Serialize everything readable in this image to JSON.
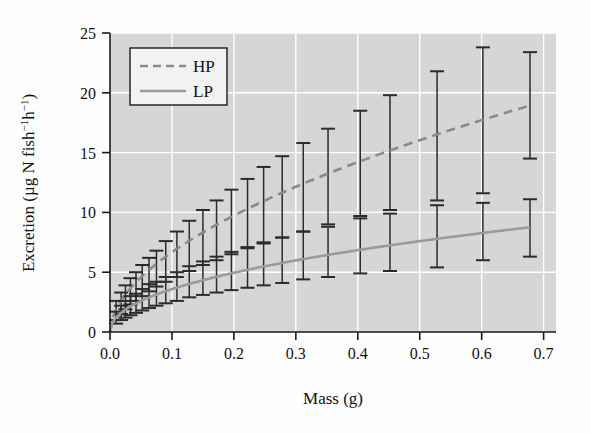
{
  "chart_data": {
    "type": "line",
    "title": "",
    "subtitle": "",
    "xlabel": "Mass (g)",
    "ylabel": "Excretion (µg N fish⁻¹h⁻¹)",
    "xlim": [
      0.0,
      0.72
    ],
    "ylim": [
      0,
      25
    ],
    "xticks": [
      "0.0",
      "0.1",
      "0.2",
      "0.3",
      "0.4",
      "0.5",
      "0.6",
      "0.7"
    ],
    "xtick_values": [
      0.0,
      0.1,
      0.2,
      0.3,
      0.4,
      0.5,
      0.6,
      0.7
    ],
    "yticks": [
      "0",
      "5",
      "10",
      "15",
      "20",
      "25"
    ],
    "ytick_values": [
      0,
      5,
      10,
      15,
      20,
      25
    ],
    "grid": true,
    "grid_color": "#ffffff",
    "plot_background": "#d6d6d6",
    "legend_position": "upper-left",
    "legend_entries": [
      {
        "label": "HP",
        "style": "dashed",
        "color": "#8a8a8a"
      },
      {
        "label": "LP",
        "style": "solid",
        "color": "#9a9a9a"
      }
    ],
    "series": [
      {
        "name": "HP",
        "style": "dashed",
        "color": "#8a8a8a",
        "fit_curve": {
          "model": "power",
          "a": 23.4,
          "b": 0.545,
          "note": "Excretion = a * Mass^b"
        },
        "points": [
          {
            "x": 0.01,
            "y": 1.8,
            "err_low": 1.0,
            "err_high": 2.6
          },
          {
            "x": 0.018,
            "y": 2.4,
            "err_low": 1.5,
            "err_high": 3.3
          },
          {
            "x": 0.025,
            "y": 2.9,
            "err_low": 1.9,
            "err_high": 3.9
          },
          {
            "x": 0.033,
            "y": 3.4,
            "err_low": 2.3,
            "err_high": 4.5
          },
          {
            "x": 0.042,
            "y": 3.8,
            "err_low": 2.6,
            "err_high": 5.0
          },
          {
            "x": 0.052,
            "y": 4.3,
            "err_low": 3.0,
            "err_high": 5.6
          },
          {
            "x": 0.063,
            "y": 4.8,
            "err_low": 3.4,
            "err_high": 6.2
          },
          {
            "x": 0.075,
            "y": 5.3,
            "err_low": 3.8,
            "err_high": 6.8
          },
          {
            "x": 0.09,
            "y": 5.9,
            "err_low": 4.2,
            "err_high": 7.6
          },
          {
            "x": 0.108,
            "y": 6.5,
            "err_low": 4.6,
            "err_high": 8.4
          },
          {
            "x": 0.128,
            "y": 7.2,
            "err_low": 5.1,
            "err_high": 9.3
          },
          {
            "x": 0.15,
            "y": 7.9,
            "err_low": 5.6,
            "err_high": 10.2
          },
          {
            "x": 0.172,
            "y": 8.5,
            "err_low": 6.0,
            "err_high": 11.0
          },
          {
            "x": 0.196,
            "y": 9.2,
            "err_low": 6.5,
            "err_high": 11.9
          },
          {
            "x": 0.222,
            "y": 9.9,
            "err_low": 7.0,
            "err_high": 12.8
          },
          {
            "x": 0.248,
            "y": 10.6,
            "err_low": 7.4,
            "err_high": 13.8
          },
          {
            "x": 0.278,
            "y": 11.3,
            "err_low": 7.9,
            "err_high": 14.7
          },
          {
            "x": 0.312,
            "y": 12.1,
            "err_low": 8.4,
            "err_high": 15.8
          },
          {
            "x": 0.352,
            "y": 13.0,
            "err_low": 9.0,
            "err_high": 17.0
          },
          {
            "x": 0.404,
            "y": 14.1,
            "err_low": 9.7,
            "err_high": 18.5
          },
          {
            "x": 0.452,
            "y": 15.0,
            "err_low": 10.2,
            "err_high": 19.8
          },
          {
            "x": 0.528,
            "y": 16.4,
            "err_low": 11.0,
            "err_high": 21.8
          },
          {
            "x": 0.602,
            "y": 17.7,
            "err_low": 11.6,
            "err_high": 23.8
          },
          {
            "x": 0.678,
            "y": 19.0,
            "err_low": 14.5,
            "err_high": 23.4
          }
        ]
      },
      {
        "name": "LP",
        "style": "solid",
        "color": "#9a9a9a",
        "fit_curve": {
          "model": "power",
          "a": 10.5,
          "b": 0.467,
          "note": "Excretion = a * Mass^b"
        },
        "points": [
          {
            "x": 0.01,
            "y": 1.2,
            "err_low": 0.7,
            "err_high": 1.7
          },
          {
            "x": 0.018,
            "y": 1.6,
            "err_low": 1.0,
            "err_high": 2.2
          },
          {
            "x": 0.025,
            "y": 1.9,
            "err_low": 1.2,
            "err_high": 2.6
          },
          {
            "x": 0.033,
            "y": 2.2,
            "err_low": 1.4,
            "err_high": 3.0
          },
          {
            "x": 0.042,
            "y": 2.4,
            "err_low": 1.6,
            "err_high": 3.2
          },
          {
            "x": 0.052,
            "y": 2.7,
            "err_low": 1.8,
            "err_high": 3.6
          },
          {
            "x": 0.063,
            "y": 3.0,
            "err_low": 2.0,
            "err_high": 4.0
          },
          {
            "x": 0.075,
            "y": 3.2,
            "err_low": 2.2,
            "err_high": 4.2
          },
          {
            "x": 0.09,
            "y": 3.5,
            "err_low": 2.4,
            "err_high": 4.6
          },
          {
            "x": 0.108,
            "y": 3.8,
            "err_low": 2.6,
            "err_high": 5.0
          },
          {
            "x": 0.128,
            "y": 4.2,
            "err_low": 2.9,
            "err_high": 5.5
          },
          {
            "x": 0.15,
            "y": 4.5,
            "err_low": 3.1,
            "err_high": 5.9
          },
          {
            "x": 0.172,
            "y": 4.8,
            "err_low": 3.3,
            "err_high": 6.3
          },
          {
            "x": 0.196,
            "y": 5.1,
            "err_low": 3.5,
            "err_high": 6.7
          },
          {
            "x": 0.222,
            "y": 5.4,
            "err_low": 3.7,
            "err_high": 7.1
          },
          {
            "x": 0.248,
            "y": 5.7,
            "err_low": 3.9,
            "err_high": 7.5
          },
          {
            "x": 0.278,
            "y": 6.0,
            "err_low": 4.1,
            "err_high": 7.9
          },
          {
            "x": 0.312,
            "y": 6.4,
            "err_low": 4.4,
            "err_high": 8.4
          },
          {
            "x": 0.352,
            "y": 6.7,
            "err_low": 4.6,
            "err_high": 8.8
          },
          {
            "x": 0.404,
            "y": 7.2,
            "err_low": 4.9,
            "err_high": 9.5
          },
          {
            "x": 0.452,
            "y": 7.5,
            "err_low": 5.1,
            "err_high": 9.9
          },
          {
            "x": 0.528,
            "y": 8.0,
            "err_low": 5.4,
            "err_high": 10.6
          },
          {
            "x": 0.602,
            "y": 8.4,
            "err_low": 6.0,
            "err_high": 10.8
          },
          {
            "x": 0.678,
            "y": 8.7,
            "err_low": 6.3,
            "err_high": 11.1
          }
        ]
      }
    ]
  }
}
